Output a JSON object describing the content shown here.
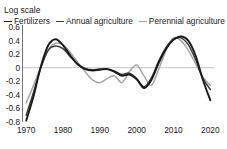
{
  "chart_data": {
    "type": "line",
    "title": "",
    "ylabel": "Log scale",
    "xlabel": "",
    "xlim": [
      1969,
      2021
    ],
    "ylim": [
      -0.8,
      0.6
    ],
    "yticks": [
      "0.6",
      "0.4",
      "0.2",
      "0",
      "-0.2",
      "-0.4",
      "-0.6",
      "-0.8"
    ],
    "ytick_values": [
      0.6,
      0.4,
      0.2,
      0,
      -0.2,
      -0.4,
      -0.6,
      -0.8
    ],
    "xticks": [
      "1970",
      "1980",
      "1990",
      "2000",
      "2010",
      "2020"
    ],
    "xtick_values": [
      1970,
      1980,
      1990,
      2000,
      2010,
      2020
    ],
    "grid": "zero-line-only",
    "legend_position": "top-left",
    "legend": [
      {
        "label": "Fertilizers",
        "color": "#1a1a1a",
        "width": 1.9
      },
      {
        "label": "Annual agriculture",
        "color": "#3d3d3d",
        "width": 1.5
      },
      {
        "label": "Perennial agriculture",
        "color": "#a6a6a6",
        "width": 1.5
      }
    ],
    "x": [
      1970,
      1972,
      1974,
      1976,
      1978,
      1980,
      1982,
      1984,
      1986,
      1988,
      1990,
      1992,
      1994,
      1996,
      1998,
      2000,
      2002,
      2004,
      2006,
      2008,
      2010,
      2012,
      2014,
      2016,
      2018,
      2020
    ],
    "series": [
      {
        "name": "Fertilizers",
        "color": "#1a1a1a",
        "width": 1.9,
        "values": [
          -0.78,
          -0.42,
          0.02,
          0.33,
          0.42,
          0.33,
          0.18,
          0.05,
          -0.02,
          -0.04,
          -0.03,
          -0.02,
          -0.06,
          -0.12,
          -0.1,
          -0.17,
          -0.3,
          -0.18,
          0.07,
          0.28,
          0.41,
          0.46,
          0.4,
          0.18,
          -0.18,
          -0.48
        ]
      },
      {
        "name": "Annual agriculture",
        "color": "#3d3d3d",
        "width": 1.5,
        "values": [
          -0.7,
          -0.36,
          0.0,
          0.26,
          0.32,
          0.28,
          0.16,
          0.05,
          -0.01,
          -0.03,
          -0.02,
          -0.02,
          -0.05,
          -0.1,
          -0.08,
          -0.16,
          -0.28,
          -0.15,
          0.1,
          0.3,
          0.42,
          0.44,
          0.34,
          0.12,
          -0.16,
          -0.32
        ]
      },
      {
        "name": "Perennial agriculture",
        "color": "#a6a6a6",
        "width": 1.5,
        "values": [
          -0.52,
          -0.26,
          0.02,
          0.26,
          0.36,
          0.34,
          0.22,
          0.08,
          -0.06,
          -0.18,
          -0.22,
          -0.16,
          -0.12,
          -0.22,
          -0.06,
          0.04,
          -0.12,
          -0.26,
          -0.02,
          0.26,
          0.44,
          0.4,
          0.26,
          0.06,
          -0.14,
          -0.26
        ]
      }
    ]
  }
}
